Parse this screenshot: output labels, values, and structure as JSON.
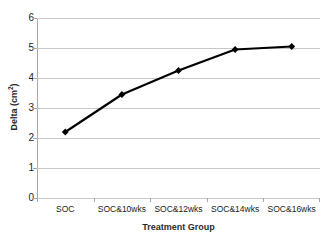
{
  "chart_data": {
    "type": "line",
    "title": "",
    "categories": [
      "SOC",
      "SOC&10wks",
      "SOC&12wks",
      "SOC&14wks",
      "SOC&16wks"
    ],
    "values": [
      2.2,
      3.45,
      4.25,
      4.95,
      5.05
    ],
    "xlabel": "Treatment Group",
    "ylabel": "Delta (cm²)",
    "ylabel_base": "Delta (cm",
    "ylabel_sup": "2",
    "ylabel_tail": ")",
    "ylim": [
      0,
      6
    ],
    "ytick_labels": [
      "6",
      "5",
      "4",
      "3",
      "2",
      "1",
      "0"
    ],
    "ytick_values": [
      6,
      5,
      4,
      3,
      2,
      1,
      0
    ],
    "grid": true,
    "legend": false,
    "series_color": "#000000",
    "grid_color": "#c8c8c8",
    "marker": "diamond"
  }
}
